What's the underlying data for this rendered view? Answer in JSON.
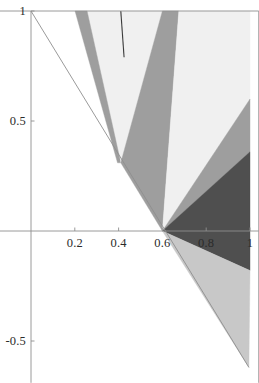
{
  "chart_data": {
    "type": "area",
    "title": "",
    "xlabel": "",
    "ylabel": "",
    "xlim": [
      -0.145,
      1.04
    ],
    "ylim": [
      -0.69,
      1.0
    ],
    "grid": false,
    "legend": null,
    "axis_color": "#8f8f8f",
    "frame_color": "#8f8f8f",
    "background": "#ffffff",
    "x_ticks": [
      {
        "value": "0.2",
        "x": 0.2
      },
      {
        "value": "0.4",
        "x": 0.4
      },
      {
        "value": "0.6",
        "x": 0.6
      },
      {
        "value": "0.8",
        "x": 0.8
      },
      {
        "value": "1",
        "x": 1.0
      }
    ],
    "y_ticks": [
      {
        "value": "1",
        "y": 1.0
      },
      {
        "value": "0.5",
        "y": 0.5
      },
      {
        "value": "-0.5",
        "y": -0.5
      }
    ],
    "region_colors": {
      "palest": "#f0f0f0",
      "light": "#c8c8c8",
      "medium": "#9e9e9e",
      "dark": "#4f4f4f",
      "line": "#3a3a3a"
    },
    "regions": [
      {
        "name": "pale-upper-left-wedge",
        "shade": "palest",
        "color": "#f0f0f0",
        "points": [
          [
            0.256,
            1.0
          ],
          [
            0.41,
            0.31
          ],
          [
            0.41,
            1.0
          ]
        ]
      },
      {
        "name": "medium-left-band",
        "shade": "medium",
        "color": "#9e9e9e",
        "points": [
          [
            0.201,
            1.0
          ],
          [
            0.256,
            1.0
          ],
          [
            0.41,
            0.31
          ],
          [
            0.395,
            0.31
          ]
        ]
      },
      {
        "name": "pale-central-wedge",
        "shade": "palest",
        "color": "#f0f0f0",
        "points": [
          [
            0.41,
            1.0
          ],
          [
            0.6,
            1.0
          ],
          [
            0.41,
            0.31
          ]
        ]
      },
      {
        "name": "medium-right-band",
        "shade": "medium",
        "color": "#9e9e9e",
        "points": [
          [
            0.6,
            1.0
          ],
          [
            0.675,
            1.0
          ],
          [
            0.6,
            0.0
          ],
          [
            0.41,
            0.31
          ]
        ]
      },
      {
        "name": "pale-right-wedge",
        "shade": "palest",
        "color": "#f0f0f0",
        "points": [
          [
            0.675,
            1.0
          ],
          [
            1.0,
            1.0
          ],
          [
            1.0,
            0.6
          ],
          [
            0.6,
            0.0
          ]
        ]
      },
      {
        "name": "medium-right-upper-wedge",
        "shade": "medium",
        "color": "#9e9e9e",
        "points": [
          [
            0.6,
            0.0
          ],
          [
            1.0,
            0.6
          ],
          [
            1.0,
            0.36
          ]
        ]
      },
      {
        "name": "dark-right-wedge",
        "shade": "dark",
        "color": "#4f4f4f",
        "points": [
          [
            0.6,
            0.0
          ],
          [
            1.0,
            0.36
          ],
          [
            1.0,
            -0.18
          ]
        ]
      },
      {
        "name": "light-lower-right-wedge",
        "shade": "light",
        "color": "#c8c8c8",
        "points": [
          [
            0.6,
            0.0
          ],
          [
            1.0,
            -0.18
          ],
          [
            0.995,
            -0.62
          ]
        ]
      }
    ],
    "lines": [
      {
        "name": "anti-diagonal-boundary",
        "color": "#8f8f8f",
        "points": [
          [
            0.0,
            1.0
          ],
          [
            0.995,
            -0.62
          ]
        ]
      },
      {
        "name": "short-dark-segment",
        "color": "#3a3a3a",
        "points": [
          [
            0.41,
            1.0
          ],
          [
            0.425,
            0.79
          ]
        ]
      }
    ]
  }
}
